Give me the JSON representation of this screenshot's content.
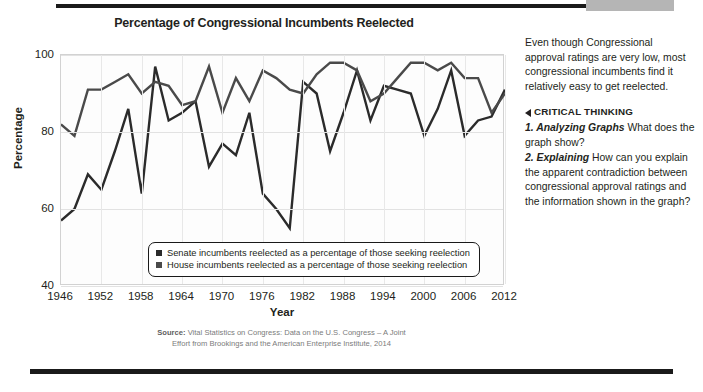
{
  "decor": {
    "top_rule": "top-dark-rule",
    "top_block": "gray-block",
    "bottom_rule": "bottom-dark-rule"
  },
  "chart_panel": {
    "title": "Percentage of Congressional Incumbents Reelected",
    "source_label": "Source:",
    "source_line1": " Vital Statistics on Congress: Data on the U.S. Congress – A Joint",
    "source_line2": "Effort from Brookings and the American Enterprise Institute, 2014"
  },
  "sidebar": {
    "paragraph": "Even though Congressional approval ratings are very low, most congressional incumbents find it relatively easy to get reelected.",
    "critical_thinking_label": "CRITICAL THINKING",
    "questions": [
      {
        "number": "1. Analyzing Graphs",
        "text": "  What does the graph show?"
      },
      {
        "number": "2. Explaining",
        "text": "  How can you explain the apparent contradiction between congressional approval ratings and the information shown in the graph?"
      }
    ]
  },
  "chart_data": {
    "type": "line",
    "title": "Percentage of Congressional Incumbents Reelected",
    "xlabel": "Year",
    "ylabel": "Percentage",
    "xlim": [
      1946,
      2012
    ],
    "ylim": [
      40,
      100
    ],
    "yticks": [
      40,
      60,
      80,
      100
    ],
    "xticks": [
      1946,
      1952,
      1958,
      1964,
      1970,
      1976,
      1982,
      1988,
      1994,
      2000,
      2006,
      2012
    ],
    "grid": true,
    "legend_position": "inside-bottom-left",
    "x": [
      1946,
      1948,
      1950,
      1952,
      1954,
      1956,
      1958,
      1960,
      1962,
      1964,
      1966,
      1968,
      1970,
      1972,
      1974,
      1976,
      1978,
      1980,
      1982,
      1984,
      1986,
      1988,
      1990,
      1992,
      1994,
      1996,
      1998,
      2000,
      2002,
      2004,
      2006,
      2008,
      2010,
      2012
    ],
    "series": [
      {
        "name": "Senate incumbents reelected as a percentage of those seeking reelection",
        "color": "#2b2b2b",
        "values": [
          57,
          60,
          69,
          65,
          75,
          86,
          64,
          97,
          83,
          85,
          88,
          71,
          77,
          74,
          85,
          64,
          60,
          55,
          93,
          90,
          75,
          85,
          96,
          83,
          92,
          91,
          90,
          79,
          86,
          96,
          79,
          83,
          84,
          91
        ]
      },
      {
        "name": "House incumbents reelected as a percentage of those seeking reelection",
        "color": "#4a4a4a",
        "values": [
          82,
          79,
          91,
          91,
          93,
          95,
          90,
          93,
          92,
          87,
          88,
          97,
          85,
          94,
          88,
          96,
          94,
          91,
          90,
          95,
          98,
          98,
          96,
          88,
          90,
          94,
          98,
          98,
          96,
          98,
          94,
          94,
          85,
          90
        ]
      }
    ],
    "legend": [
      {
        "label": "Senate incumbents reelected as a percentage of those seeking reelection",
        "color": "#2b2b2b"
      },
      {
        "label": "House incumbents reelected as a percentage of those seeking reelection",
        "color": "#4a4a4a"
      }
    ]
  }
}
